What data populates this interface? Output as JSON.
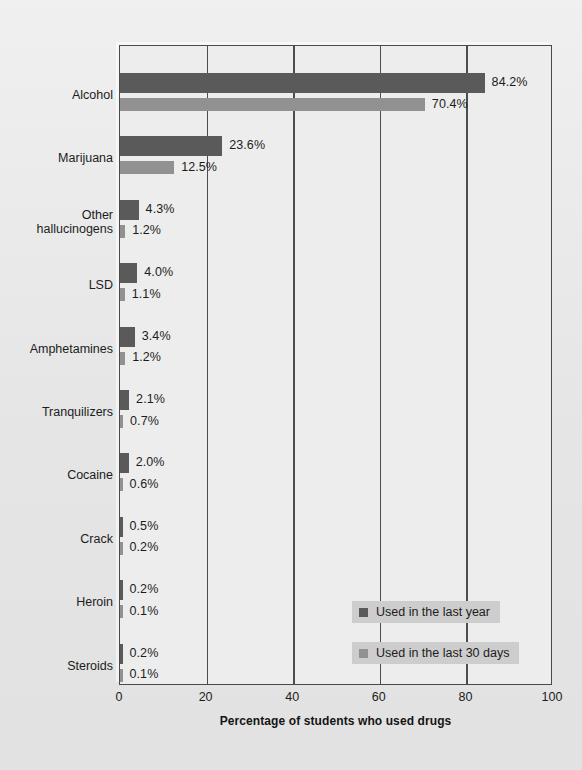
{
  "chart_data": {
    "type": "bar",
    "orientation": "horizontal",
    "title": "",
    "xlabel": "Percentage of students who used drugs",
    "ylabel": "",
    "xlim": [
      0,
      100
    ],
    "xticks": [
      "0",
      "20",
      "40",
      "60",
      "80",
      "100"
    ],
    "grid": true,
    "legend_position": "inside-bottom-right",
    "categories": [
      "Alcohol",
      "Marijuana",
      "Other\nhallucinogens",
      "LSD",
      "Amphetamines",
      "Tranquilizers",
      "Cocaine",
      "Crack",
      "Heroin",
      "Steroids"
    ],
    "series": [
      {
        "name": "Used in the last year",
        "color": "#5a5a5a",
        "values": [
          84.2,
          23.6,
          4.3,
          4.0,
          3.4,
          2.1,
          2.0,
          0.5,
          0.2,
          0.2
        ],
        "labels": [
          "84.2%",
          "23.6%",
          "4.3%",
          "4.0%",
          "3.4%",
          "2.1%",
          "2.0%",
          "0.5%",
          "0.2%",
          "0.2%"
        ]
      },
      {
        "name": "Used in the last 30 days",
        "color": "#919191",
        "values": [
          70.4,
          12.5,
          1.2,
          1.1,
          1.2,
          0.7,
          0.6,
          0.2,
          0.1,
          0.1
        ],
        "labels": [
          "70.4%",
          "12.5%",
          "1.2%",
          "1.1%",
          "1.2%",
          "0.7%",
          "0.6%",
          "0.2%",
          "0.1%",
          "0.1%"
        ]
      }
    ]
  },
  "legend": {
    "items": [
      {
        "label": "Used in the last year",
        "swatch": "year"
      },
      {
        "label": "Used in the last 30 days",
        "swatch": "month"
      }
    ]
  },
  "axis": {
    "x_title": "Percentage of students who used drugs",
    "x_tick_labels": [
      "0",
      "20",
      "40",
      "60",
      "80",
      "100"
    ]
  },
  "colors": {
    "series_year": "#5a5a5a",
    "series_month": "#919191",
    "plot_background": "#ededed",
    "page_background": "#e9e9e9",
    "frame": "#4a4a4a",
    "legend_background": "#cdcdcd"
  }
}
